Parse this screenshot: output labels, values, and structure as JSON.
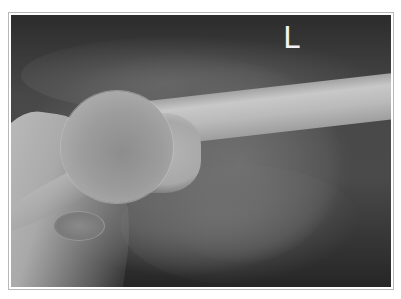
{
  "image": {
    "subject": "Left shoulder X-ray (humerus and glenohumeral joint)",
    "side_marker": "L",
    "colors": {
      "background": "#ffffff",
      "frame_border": "#b8b8b8",
      "film_dark": "#2c2c2c",
      "bone_light": "#c8c8c8",
      "marker": "#f2f2f2"
    }
  }
}
